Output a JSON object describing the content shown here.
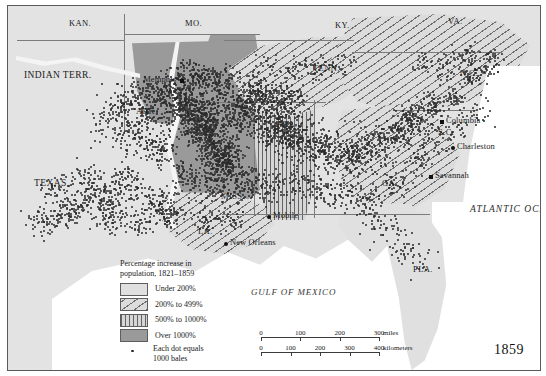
{
  "figure": {
    "year_label": "1859",
    "ocean_label": "ATLANTIC OCEAN",
    "gulf_label": "GULF OF MEXICO"
  },
  "legend": {
    "title_line1": "Percentage increase in",
    "title_line2": "population, 1821–1859",
    "items": [
      {
        "label": "Under 200%",
        "pattern": "solid-light",
        "color": "#e0e0e0"
      },
      {
        "label": "200% to 499%",
        "pattern": "diagonal-hatch",
        "color": "#dcdcdc"
      },
      {
        "label": "500% to 1000%",
        "pattern": "vertical-hatch",
        "color": "#d6d6d6"
      },
      {
        "label": "Over 1000%",
        "pattern": "solid-dark",
        "color": "#9a9a9a"
      }
    ],
    "dot_item": {
      "label_line1": "Each dot equals",
      "label_line2": "1000 bales"
    }
  },
  "scale": {
    "miles": {
      "ticks": [
        "0",
        "100",
        "200",
        "300"
      ],
      "unit": "miles"
    },
    "kilometers": {
      "ticks": [
        "0",
        "100",
        "200",
        "300",
        "400"
      ],
      "unit": "kilometers"
    }
  },
  "states": [
    {
      "name": "KAN.",
      "x": 61,
      "y": 12
    },
    {
      "name": "MO.",
      "x": 177,
      "y": 12
    },
    {
      "name": "KY.",
      "x": 327,
      "y": 14
    },
    {
      "name": "VA.",
      "x": 440,
      "y": 10
    },
    {
      "name": "INDIAN TERR.",
      "x": 16,
      "y": 64
    },
    {
      "name": "TENN.",
      "x": 305,
      "y": 57
    },
    {
      "name": "N.C.",
      "x": 452,
      "y": 62
    },
    {
      "name": "ARK.",
      "x": 128,
      "y": 100
    },
    {
      "name": "ALA.",
      "x": 268,
      "y": 113
    },
    {
      "name": "S.C.",
      "x": 430,
      "y": 121
    },
    {
      "name": "TEXAS",
      "x": 26,
      "y": 172
    },
    {
      "name": "MISS.",
      "x": 213,
      "y": 185
    },
    {
      "name": "GA.",
      "x": 374,
      "y": 172
    },
    {
      "name": "LA.",
      "x": 190,
      "y": 220
    },
    {
      "name": "FLA.",
      "x": 405,
      "y": 258
    }
  ],
  "cities": [
    {
      "name": "Memphis",
      "x": 172,
      "y": 73,
      "marker": "square",
      "side": "left"
    },
    {
      "name": "Columbia",
      "x": 432,
      "y": 114,
      "marker": "square",
      "side": "right"
    },
    {
      "name": "Charleston",
      "x": 443,
      "y": 140,
      "marker": "dot",
      "side": "right"
    },
    {
      "name": "Savannah",
      "x": 421,
      "y": 169,
      "marker": "square",
      "side": "right"
    },
    {
      "name": "Mobile",
      "x": 259,
      "y": 209,
      "marker": "dot",
      "side": "right"
    },
    {
      "name": "New Orleans",
      "x": 216,
      "y": 236,
      "marker": "dot",
      "side": "right"
    }
  ]
}
